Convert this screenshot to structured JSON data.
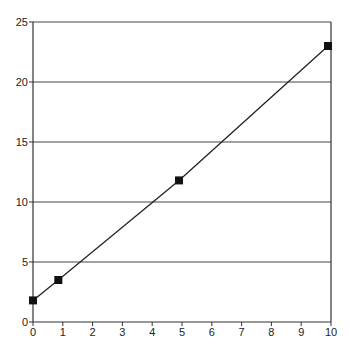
{
  "chart_data": {
    "type": "line",
    "title": "",
    "xlabel": "",
    "ylabel": "",
    "xlim": [
      0,
      10
    ],
    "ylim": [
      0,
      25
    ],
    "x_ticks": [
      0,
      1,
      2,
      3,
      4,
      5,
      6,
      7,
      8,
      9,
      10
    ],
    "y_ticks": [
      0,
      5,
      10,
      15,
      20,
      25
    ],
    "grid": {
      "horizontal": true,
      "vertical": false
    },
    "legend": null,
    "series": [
      {
        "name": "series-1",
        "marker": "square",
        "points": [
          {
            "x": 0,
            "y": 1.8
          },
          {
            "x": 0.85,
            "y": 3.5
          },
          {
            "x": 4.9,
            "y": 11.8
          },
          {
            "x": 9.9,
            "y": 23.0
          }
        ]
      }
    ]
  },
  "style": {
    "line_color": "#222222",
    "axis_color": "#333333",
    "grid_color": "#444444",
    "marker_color": "#111111"
  }
}
